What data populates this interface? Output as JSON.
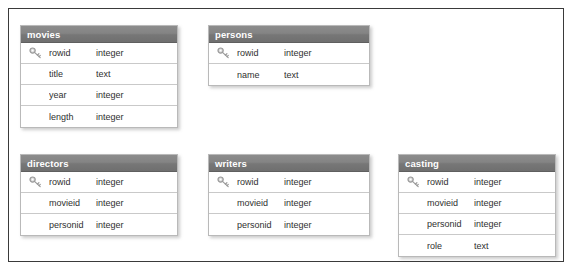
{
  "diagram": {
    "key_icon_name": "primary-key-icon",
    "frame_border_color": "#3a3a3a",
    "header_background_color": "#808080",
    "header_text_color": "#ffffff",
    "row_background_color": "#ffffff",
    "row_border_color": "#c9c9c9",
    "card_border_color": "#b9b9b9"
  },
  "tables": [
    {
      "name": "movies",
      "x": 20,
      "y": 25,
      "width": 158,
      "columns": [
        {
          "key": true,
          "name": "rowid",
          "type": "integer"
        },
        {
          "key": false,
          "name": "title",
          "type": "text"
        },
        {
          "key": false,
          "name": "year",
          "type": "integer"
        },
        {
          "key": false,
          "name": "length",
          "type": "integer"
        }
      ]
    },
    {
      "name": "persons",
      "x": 208,
      "y": 25,
      "width": 162,
      "columns": [
        {
          "key": true,
          "name": "rowid",
          "type": "integer"
        },
        {
          "key": false,
          "name": "name",
          "type": "text"
        }
      ]
    },
    {
      "name": "directors",
      "x": 20,
      "y": 154,
      "width": 158,
      "columns": [
        {
          "key": true,
          "name": "rowid",
          "type": "integer"
        },
        {
          "key": false,
          "name": "movieid",
          "type": "integer"
        },
        {
          "key": false,
          "name": "personid",
          "type": "integer"
        }
      ]
    },
    {
      "name": "writers",
      "x": 208,
      "y": 154,
      "width": 162,
      "columns": [
        {
          "key": true,
          "name": "rowid",
          "type": "integer"
        },
        {
          "key": false,
          "name": "movieid",
          "type": "integer"
        },
        {
          "key": false,
          "name": "personid",
          "type": "integer"
        }
      ]
    },
    {
      "name": "casting",
      "x": 398,
      "y": 154,
      "width": 158,
      "columns": [
        {
          "key": true,
          "name": "rowid",
          "type": "integer"
        },
        {
          "key": false,
          "name": "movieid",
          "type": "integer"
        },
        {
          "key": false,
          "name": "personid",
          "type": "integer"
        },
        {
          "key": false,
          "name": "role",
          "type": "text"
        }
      ]
    }
  ]
}
